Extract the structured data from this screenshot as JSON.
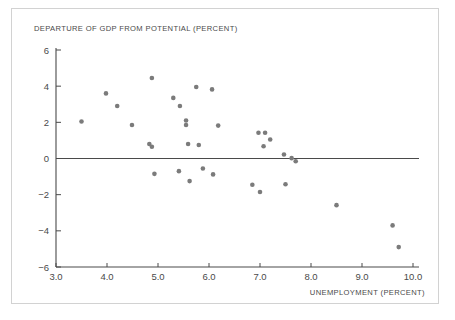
{
  "figure": {
    "background_color": "#ffffff",
    "frame_color": "#d2d2d2",
    "axis_color": "#4a4a4a",
    "marker_color": "#7b7b7b"
  },
  "chart_data": {
    "type": "scatter",
    "title": "",
    "xlabel": "UNEMPLOYMENT (PERCENT)",
    "ylabel": "DEPARTURE OF GDP FROM POTENTIAL (PERCENT)",
    "xlim": [
      3.0,
      10.0
    ],
    "ylim": [
      -6,
      6
    ],
    "xticks": [
      3.0,
      4.0,
      5.0,
      6.0,
      7.0,
      8.0,
      9.0,
      10.0
    ],
    "xtick_labels": [
      "3.0",
      "4.0",
      "5.0",
      "6.0",
      "7.0",
      "8.0",
      "9.0",
      "10.0"
    ],
    "yticks": [
      6,
      4,
      2,
      0,
      -2,
      -4,
      -6
    ],
    "ytick_labels": [
      "6",
      "4",
      "2",
      "0",
      "−2",
      "−4",
      "−6"
    ],
    "grid": false,
    "legend": null,
    "reference_lines": [
      {
        "orientation": "horizontal",
        "value": 0
      }
    ],
    "marker_size": 4.6,
    "points": [
      {
        "x": 3.5,
        "y": 2.05
      },
      {
        "x": 3.98,
        "y": 3.6
      },
      {
        "x": 4.2,
        "y": 2.9
      },
      {
        "x": 4.49,
        "y": 1.85
      },
      {
        "x": 4.83,
        "y": 0.8
      },
      {
        "x": 4.88,
        "y": 0.65
      },
      {
        "x": 4.88,
        "y": 4.45
      },
      {
        "x": 4.93,
        "y": -0.85
      },
      {
        "x": 5.3,
        "y": 3.35
      },
      {
        "x": 5.43,
        "y": 2.9
      },
      {
        "x": 5.41,
        "y": -0.7
      },
      {
        "x": 5.55,
        "y": 2.1
      },
      {
        "x": 5.55,
        "y": 1.85
      },
      {
        "x": 5.59,
        "y": 0.8
      },
      {
        "x": 5.62,
        "y": -1.25
      },
      {
        "x": 5.75,
        "y": 3.95
      },
      {
        "x": 5.8,
        "y": 0.75
      },
      {
        "x": 5.88,
        "y": -0.55
      },
      {
        "x": 6.06,
        "y": 3.82
      },
      {
        "x": 6.08,
        "y": -0.88
      },
      {
        "x": 6.18,
        "y": 1.82
      },
      {
        "x": 6.85,
        "y": -1.45
      },
      {
        "x": 6.97,
        "y": 1.42
      },
      {
        "x": 7.0,
        "y": -1.85
      },
      {
        "x": 7.07,
        "y": 0.68
      },
      {
        "x": 7.1,
        "y": 1.42
      },
      {
        "x": 7.2,
        "y": 1.05
      },
      {
        "x": 7.47,
        "y": 0.22
      },
      {
        "x": 7.5,
        "y": -1.42
      },
      {
        "x": 7.62,
        "y": 0.02
      },
      {
        "x": 7.7,
        "y": -0.15
      },
      {
        "x": 8.5,
        "y": -2.58
      },
      {
        "x": 9.6,
        "y": -3.7
      },
      {
        "x": 9.72,
        "y": -4.9
      }
    ]
  }
}
